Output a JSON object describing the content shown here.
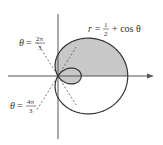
{
  "chart_data": {
    "type": "line",
    "title": "",
    "curve": {
      "name": "limacon",
      "equation_label": {
        "lhs": "r",
        "frac_num": "1",
        "frac_den": "2",
        "rhs": "+ cos θ"
      },
      "a": 0.5,
      "b": 1.0,
      "theta_range": [
        0,
        6.283185307
      ]
    },
    "shaded_region": {
      "description": "area inside the curve above the polar axis (outer loop) plus inner loop",
      "color": "#c8c8c8"
    },
    "rays": [
      {
        "theta_label": "θ",
        "frac_num": "2π",
        "frac_den": "3",
        "theta": 2.094395102,
        "style": "dashed"
      },
      {
        "theta_label": "θ",
        "frac_num": "4π",
        "frac_den": "3",
        "theta": 4.188790205,
        "style": "dashed"
      }
    ],
    "axes": {
      "x_arrow": true,
      "y_arrow": false
    },
    "colors": {
      "curve": "#333333",
      "axis": "#555555",
      "fill": "#c8c8c8",
      "dashed": "#555555"
    }
  }
}
